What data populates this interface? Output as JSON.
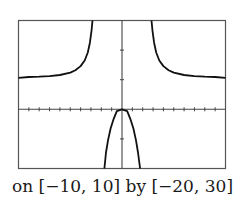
{
  "caption": "on [−10, 10] by [−20, 30]",
  "colors": {
    "frame": "#555555",
    "axis": "#444444",
    "curve": "#111111",
    "background": "#ffffff"
  },
  "chart_data": {
    "type": "line",
    "title": "",
    "caption": "on [−10, 10] by [−20, 30]",
    "xlabel": "",
    "ylabel": "",
    "xlim": [
      -10,
      10
    ],
    "ylim": [
      -20,
      30
    ],
    "xscale_ticks": 1,
    "yscale_ticks": 10,
    "x_ticks": [
      -10,
      -9,
      -8,
      -7,
      -6,
      -5,
      -4,
      -3,
      -2,
      -1,
      0,
      1,
      2,
      3,
      4,
      5,
      6,
      7,
      8,
      9,
      10
    ],
    "y_ticks": [
      -20,
      -10,
      0,
      10,
      20,
      30
    ],
    "grid": false,
    "legend": null,
    "vertical_asymptotes_approx": [
      -2.8,
      2.8
    ],
    "horizontal_asymptote_approx": 10,
    "series": [
      {
        "name": "left-branch",
        "x": [
          -10,
          -9,
          -8,
          -7,
          -6,
          -5,
          -4.5,
          -4,
          -3.6,
          -3.3,
          -3.1,
          -2.95,
          -2.85
        ],
        "y": [
          10.6,
          10.9,
          11.0,
          11.2,
          11.6,
          12.4,
          13.2,
          14.6,
          16.5,
          19.2,
          22.5,
          26.5,
          30
        ]
      },
      {
        "name": "middle-branch",
        "x": [
          -1.7,
          -1.55,
          -1.35,
          -1.1,
          -0.8,
          -0.5,
          0,
          0.5,
          0.8,
          1.1,
          1.35,
          1.55,
          1.75
        ],
        "y": [
          -20,
          -14.6,
          -10.5,
          -6.5,
          -3.2,
          -0.6,
          0,
          -0.6,
          -3.2,
          -6.5,
          -10.5,
          -14.6,
          -20
        ]
      },
      {
        "name": "right-branch",
        "x": [
          2.85,
          2.95,
          3.1,
          3.3,
          3.6,
          4,
          4.5,
          5,
          6,
          7,
          8,
          9,
          10
        ],
        "y": [
          30,
          26.5,
          22.5,
          19.2,
          16.5,
          14.6,
          13.2,
          12.4,
          11.6,
          11.2,
          11.0,
          10.9,
          10.6
        ]
      }
    ]
  }
}
